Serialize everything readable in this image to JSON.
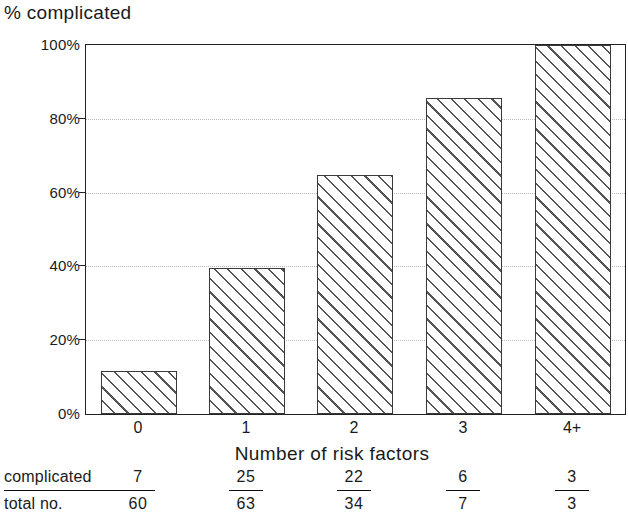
{
  "chart_data": {
    "type": "bar",
    "title": "% complicated",
    "xlabel": "Number of risk factors",
    "ylabel": "% complicated",
    "categories": [
      "0",
      "1",
      "2",
      "3",
      "4+"
    ],
    "values": [
      11.7,
      39.7,
      64.7,
      85.7,
      100.0
    ],
    "ylim": [
      0,
      100
    ],
    "yticks": [
      "0%",
      "20%",
      "40%",
      "60%",
      "80%",
      "100%"
    ],
    "ytick_values": [
      0,
      20,
      40,
      60,
      80,
      100
    ],
    "grid": true,
    "legend": "none",
    "bar_style": "diagonal-hatch",
    "annotations": {
      "row_label_numerator": "complicated",
      "row_label_denominator": "total no.",
      "fractions": [
        {
          "numerator": "7",
          "denominator": "60"
        },
        {
          "numerator": "25",
          "denominator": "63"
        },
        {
          "numerator": "22",
          "denominator": "34"
        },
        {
          "numerator": "6",
          "denominator": "7"
        },
        {
          "numerator": "3",
          "denominator": "3"
        }
      ]
    }
  },
  "colors": {
    "axis": "#222222",
    "grid": "#b9b9b9",
    "hatch": "#555555",
    "text": "#1a1a1a",
    "background": "#ffffff"
  }
}
